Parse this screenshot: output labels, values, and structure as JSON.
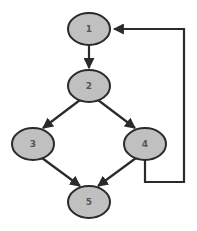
{
  "diagram": {
    "type": "control-flow-graph",
    "colors": {
      "node_fill": "#c0c0c0",
      "stroke": "#2a2a2a",
      "label": "#555555",
      "background": "#ffffff"
    },
    "nodes": [
      {
        "id": "1",
        "label": "1",
        "cx": 89,
        "cy": 29
      },
      {
        "id": "2",
        "label": "2",
        "cx": 89,
        "cy": 86
      },
      {
        "id": "3",
        "label": "3",
        "cx": 33,
        "cy": 144
      },
      {
        "id": "4",
        "label": "4",
        "cx": 145,
        "cy": 144
      },
      {
        "id": "5",
        "label": "5",
        "cx": 89,
        "cy": 202
      }
    ],
    "edges": [
      {
        "from": "1",
        "to": "2"
      },
      {
        "from": "2",
        "to": "3"
      },
      {
        "from": "2",
        "to": "4"
      },
      {
        "from": "3",
        "to": "5"
      },
      {
        "from": "4",
        "to": "5"
      },
      {
        "from": "4",
        "to": "1",
        "routing": "orthogonal-loop-back-right"
      }
    ]
  }
}
